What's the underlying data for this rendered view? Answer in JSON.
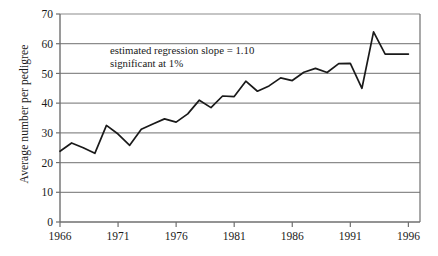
{
  "chart_data": {
    "type": "line",
    "title": "",
    "xlabel": "",
    "ylabel": "Average number per pedigree",
    "xlim": [
      1966,
      1997
    ],
    "ylim": [
      0,
      70
    ],
    "grid": true,
    "legend": false,
    "x_ticks": [
      "1966",
      "1971",
      "1976",
      "1981",
      "1986",
      "1991",
      "1996"
    ],
    "x_tick_values": [
      1966,
      1971,
      1976,
      1981,
      1986,
      1991,
      1996
    ],
    "y_ticks": [
      "0",
      "10",
      "20",
      "30",
      "40",
      "50",
      "60",
      "70"
    ],
    "y_tick_values": [
      0,
      10,
      20,
      30,
      40,
      50,
      60,
      70
    ],
    "annotations": [
      "estimated regression slope = 1.10",
      "significant at 1%"
    ],
    "series": [
      {
        "name": "Average number per pedigree",
        "color": "#1a1a1a",
        "x": [
          1966,
          1967,
          1968,
          1969,
          1970,
          1971,
          1972,
          1973,
          1974,
          1975,
          1976,
          1977,
          1978,
          1979,
          1980,
          1981,
          1982,
          1983,
          1984,
          1985,
          1986,
          1987,
          1988,
          1989,
          1990,
          1991,
          1992,
          1993,
          1994,
          1995,
          1996
        ],
        "values": [
          23.8,
          26.6,
          25.0,
          23.1,
          32.5,
          29.6,
          25.8,
          31.2,
          33.0,
          34.7,
          33.6,
          36.4,
          41.0,
          38.5,
          42.4,
          42.2,
          47.4,
          44.0,
          45.8,
          48.5,
          47.6,
          50.4,
          51.7,
          50.3,
          53.3,
          53.4,
          45.0,
          64.0,
          56.5,
          56.5,
          56.5
        ]
      }
    ]
  },
  "annotation": {
    "line1": "estimated regression slope = 1.10",
    "line2": "significant at 1%"
  },
  "axes": {
    "y_label": "Average number per pedigree"
  }
}
